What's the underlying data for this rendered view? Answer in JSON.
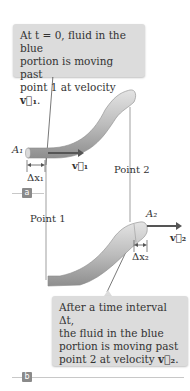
{
  "callout_top": {
    "line1": "At t = 0, fluid in the blue",
    "line2": "portion is moving past",
    "line3_prefix": "point 1 at velocity ",
    "line3_vector": "v⃗₁",
    "line3_suffix": "."
  },
  "callout_bottom": {
    "line1": "After a time interval Δt,",
    "line2": "the fluid in the blue",
    "line3": "portion is moving past",
    "line4_prefix": "point 2 at velocity ",
    "line4_vector": "v⃗₂",
    "line4_suffix": "."
  },
  "labels": {
    "area1": "A₁",
    "velocity1": "v⃗₁",
    "dx1": "Δx₁",
    "point1": "Point 1",
    "point2": "Point 2",
    "area2": "A₂",
    "velocity2": "v⃗₂",
    "dx2": "Δx₂"
  },
  "panels": {
    "a": "a",
    "b": "b"
  },
  "colors": {
    "pipe": "#bdbdbd",
    "callout_bg": "#dcdcdc",
    "arrow": "#555555",
    "panel_tag": "#8a8a8a"
  }
}
